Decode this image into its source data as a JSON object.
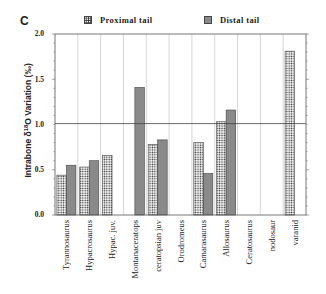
{
  "panel_label": "C",
  "legend": [
    {
      "label": "Proximal tail",
      "pattern": "dotted"
    },
    {
      "label": "Distal tail",
      "pattern": "solid-gray"
    }
  ],
  "y_axis": {
    "label": "Intrabone δ18O Variation (‰)",
    "ticks": [
      "2.0",
      "1.5",
      "1.0",
      "0.5",
      "0.0"
    ]
  },
  "chart_data": {
    "type": "bar",
    "title": "",
    "xlabel": "",
    "ylabel": "Intrabone δ18O Variation (‰)",
    "ylim": [
      0,
      2.0
    ],
    "categories": [
      "Tyrannosaurus",
      "Hypacrosaurus",
      "Hypac. juv.",
      "Montanaceratops",
      "ceratopsian juv",
      "Orodromeus",
      "Camarasaurus",
      "Allosaurus",
      "Ceratosaurus",
      "nodosaur",
      "varanid"
    ],
    "series": [
      {
        "name": "Proximal tail",
        "values": [
          0.44,
          0.53,
          0.66,
          null,
          0.78,
          null,
          0.8,
          1.03,
          null,
          null,
          1.81
        ]
      },
      {
        "name": "Distal tail",
        "values": [
          0.55,
          0.6,
          null,
          1.41,
          0.83,
          null,
          0.46,
          1.16,
          null,
          null,
          null
        ]
      }
    ],
    "reference_line": 1.01,
    "grid": "vertical category separators",
    "legend_position": "top"
  }
}
